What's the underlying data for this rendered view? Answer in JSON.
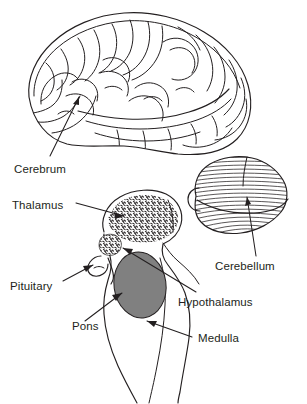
{
  "figure": {
    "background_color": "#ffffff",
    "ink_color": "#231f20",
    "cerebrum_fill_light": "#fbfbfb",
    "cerebrum_fill_dark": "#b9b9b9",
    "cerebellum_fill": "#ffffff",
    "pons_fill": "#808080",
    "thalamus_fill": "#ffffff",
    "brainstem_fill": "#ffffff"
  },
  "labels": {
    "cerebrum": "Cerebrum",
    "thalamus": "Thalamus",
    "pituitary": "Pituitary",
    "pons": "Pons",
    "cerebellum": "Cerebellum",
    "hypothalamus": "Hypothalamus",
    "medulla": "Medulla"
  },
  "structures": [
    {
      "name": "cerebrum",
      "label": "Cerebrum",
      "shading": "gradient-gray",
      "texture": "gyri-sulci"
    },
    {
      "name": "cerebellum",
      "label": "Cerebellum",
      "shading": "white",
      "texture": "horizontal-folia"
    },
    {
      "name": "thalamus",
      "label": "Thalamus",
      "shading": "white",
      "texture": "stippled"
    },
    {
      "name": "hypothalamus",
      "label": "Hypothalamus",
      "shading": "white",
      "texture": "stippled"
    },
    {
      "name": "pituitary",
      "label": "Pituitary",
      "shading": "white",
      "texture": "outline"
    },
    {
      "name": "pons",
      "label": "Pons",
      "shading": "solid-gray",
      "texture": "solid"
    },
    {
      "name": "medulla",
      "label": "Medulla",
      "shading": "white",
      "texture": "outline"
    }
  ]
}
